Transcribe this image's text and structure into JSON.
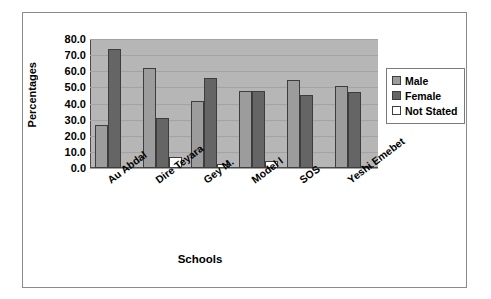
{
  "chart_data": {
    "type": "bar",
    "title": "",
    "xlabel": "Schools",
    "ylabel": "Percentages",
    "ylim": [
      0,
      80
    ],
    "ytick_step": 10,
    "ytick_labels": [
      "80.0",
      "70.0",
      "60.0",
      "50.0",
      "40.0",
      "30.0",
      "20.0",
      "10.0",
      "0.0"
    ],
    "grid": true,
    "legend_position": "right",
    "categories": [
      "Au Abdal",
      "Dire Teyara",
      "Gey M.",
      "Model I",
      "SOS",
      "Yeshi Emebet"
    ],
    "series": [
      {
        "name": "Male",
        "color": "#9c9c9c",
        "values": [
          26.5,
          61.8,
          41.5,
          47.8,
          54.7,
          51.0
        ]
      },
      {
        "name": "Female",
        "color": "#656565",
        "values": [
          73.5,
          31.0,
          55.7,
          47.8,
          45.0,
          47.0
        ]
      },
      {
        "name": "Not Stated",
        "color": "#ffffff",
        "values": [
          0.0,
          6.8,
          2.2,
          4.6,
          0.0,
          1.3
        ]
      }
    ]
  },
  "axes": {
    "y_title": "Percentages",
    "x_title": "Schools"
  },
  "legend": {
    "items": [
      {
        "label": "Male",
        "swatch": "male"
      },
      {
        "label": "Female",
        "swatch": "female"
      },
      {
        "label": "Not Stated",
        "swatch": "ns"
      }
    ]
  }
}
